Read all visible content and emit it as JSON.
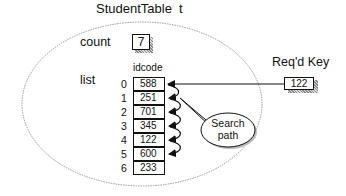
{
  "title": "StudentTable  t",
  "count": {
    "label": "count",
    "value": "7"
  },
  "list": {
    "label": "list",
    "column_header": "idcode",
    "rows": [
      {
        "index": "0",
        "idcode": "588"
      },
      {
        "index": "1",
        "idcode": "251"
      },
      {
        "index": "2",
        "idcode": "701"
      },
      {
        "index": "3",
        "idcode": "345"
      },
      {
        "index": "4",
        "idcode": "122"
      },
      {
        "index": "5",
        "idcode": "600"
      },
      {
        "index": "6",
        "idcode": "233"
      }
    ]
  },
  "required_key": {
    "label": "Req'd Key",
    "value": "122"
  },
  "callout": {
    "line1": "Search",
    "line2": "path"
  },
  "colors": {
    "ink": "#111111",
    "ellipse": "#9a9a9a",
    "shadow": "#888888"
  }
}
